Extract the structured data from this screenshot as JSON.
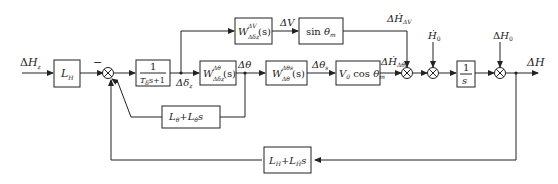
{
  "diagram": {
    "type": "block-diagram",
    "inputs": {
      "main": "ΔH_z",
      "hdot0": "Ḣ₀",
      "h0": "ΔH₀"
    },
    "output": "ΔH",
    "blocks": {
      "LH": {
        "text": "L",
        "sub": "H"
      },
      "lag": {
        "num": "1",
        "den_a": "T",
        "den_sub": "δ",
        "den_b": "s+1"
      },
      "Wtheta": {
        "main": "W",
        "sup": "Δθ",
        "sub": "Δδz",
        "arg": "(s)"
      },
      "WV": {
        "main": "W",
        "sup": "ΔV",
        "sub": "Δδz",
        "arg": "(s)"
      },
      "sin": {
        "a": "sin θ",
        "sub": "m"
      },
      "Wthetas": {
        "main": "W",
        "sup": "Δθs",
        "sub": "Δθ",
        "arg": "(s)"
      },
      "Vcos": {
        "a": "V",
        "sub0": "0",
        "b": "cos θ",
        "sub": "m"
      },
      "integrator": {
        "num": "1",
        "den": "s"
      },
      "inner_fb": {
        "a": "L",
        "asub": "θ",
        "plus": "+",
        "b": "L",
        "bsub": "θ̇",
        "c": "s"
      },
      "outer_fb": {
        "a": "L",
        "asub": "H",
        "plus": "+",
        "b": "L",
        "bsub": "Ḣ",
        "c": "s"
      }
    },
    "signals": {
      "delta_z": {
        "a": "Δδ",
        "sub": "z"
      },
      "dtheta": "Δθ",
      "dtheta_s": {
        "a": "Δθ",
        "sub": "s"
      },
      "dV": "ΔV",
      "dHdot_dV": {
        "a": "ΔḢ",
        "sub": "ΔV"
      },
      "dHdot_dthetas": {
        "a": "ΔḢ",
        "sub": "Δθs"
      },
      "minus_sign": "−"
    }
  }
}
